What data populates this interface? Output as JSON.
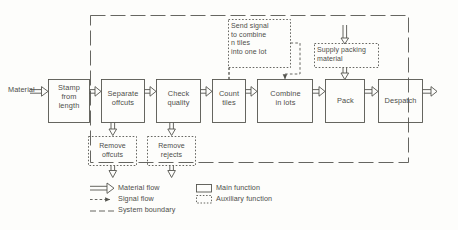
{
  "diagram": {
    "colors": {
      "ink": "#55554f",
      "paper": "#fdfdfb"
    }
  },
  "inputs": [
    {
      "name": "material-input-label",
      "label": "Material"
    }
  ],
  "main_functions": [
    {
      "id": "stamp",
      "label": "Stamp from length",
      "lines": [
        "Stamp",
        "from",
        "length"
      ]
    },
    {
      "id": "separate",
      "label": "Separate offcuts",
      "lines": [
        "Separate",
        "offcuts"
      ]
    },
    {
      "id": "check",
      "label": "Check quality",
      "lines": [
        "Check",
        "quality"
      ]
    },
    {
      "id": "count",
      "label": "Count tiles",
      "lines": [
        "Count",
        "tiles"
      ]
    },
    {
      "id": "combine",
      "label": "Combine in lots",
      "lines": [
        "Combine",
        "in lots"
      ]
    },
    {
      "id": "pack",
      "label": "Pack",
      "lines": [
        "Pack"
      ]
    },
    {
      "id": "despatch",
      "label": "Despatch",
      "lines": [
        "Despatch"
      ]
    }
  ],
  "auxiliary_functions": [
    {
      "id": "send-signal",
      "label": "Send signal to combine n tiles into one lot",
      "lines": [
        "Send signal",
        "to combine",
        "n tiles",
        "into one lot"
      ]
    },
    {
      "id": "supply-packing",
      "label": "Supply packing material",
      "lines": [
        "Supply packing",
        "material"
      ]
    },
    {
      "id": "remove-offcuts",
      "label": "Remove offcuts",
      "lines": [
        "Remove",
        "offcuts"
      ]
    },
    {
      "id": "remove-rejects",
      "label": "Remove rejects",
      "lines": [
        "Remove",
        "rejects"
      ]
    }
  ],
  "legend": {
    "flows": [
      {
        "id": "material-flow",
        "label": "Material flow",
        "symbol": "hollow-arrow-icon"
      },
      {
        "id": "signal-flow",
        "label": "Signal flow",
        "symbol": "dashed-arrow-icon"
      },
      {
        "id": "system-boundary",
        "label": "System boundary",
        "symbol": "long-dash-line-icon"
      }
    ],
    "functions": [
      {
        "id": "main-function",
        "label": "Main function",
        "symbol": "solid-box-icon"
      },
      {
        "id": "auxiliary-function",
        "label": "Auxiliary function",
        "symbol": "dotted-box-icon"
      }
    ]
  }
}
